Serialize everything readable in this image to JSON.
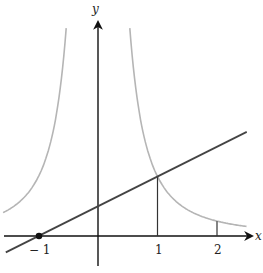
{
  "chart_data": {
    "type": "line",
    "title": "",
    "xlabel": "x",
    "ylabel": "y",
    "xlim": [
      -1.65,
      2.55
    ],
    "ylim": [
      -0.6,
      4.0
    ],
    "grid": false,
    "x_ticks": [
      -1,
      1,
      2
    ],
    "x_tick_labels": [
      "− 1",
      "1",
      "2"
    ],
    "series": [
      {
        "name": "curve y = 1/x^2",
        "color": "#b5b5b5",
        "type": "curve",
        "formula": "1/x^2",
        "points_right": [
          [
            0.55,
            3.3
          ],
          [
            0.75,
            1.78
          ],
          [
            1,
            1
          ],
          [
            1.5,
            0.44
          ],
          [
            2,
            0.25
          ],
          [
            2.5,
            0.16
          ]
        ],
        "points_left": [
          [
            -0.55,
            3.3
          ],
          [
            -0.75,
            1.78
          ],
          [
            -1,
            1
          ],
          [
            -1.2,
            0.69
          ],
          [
            -1.6,
            0.39
          ]
        ]
      },
      {
        "name": "line y = (x+1)/2",
        "color": "#444444",
        "type": "line",
        "formula": "(x+1)/2",
        "points": [
          [
            -1.55,
            -0.27
          ],
          [
            -1,
            0
          ],
          [
            0,
            0.5
          ],
          [
            1,
            1
          ],
          [
            2.5,
            1.75
          ]
        ]
      }
    ],
    "annotations": [
      {
        "type": "point",
        "x": -1,
        "y": 0,
        "label": "− 1"
      },
      {
        "type": "vertical-segment",
        "x": 1,
        "from": 0,
        "to": 1
      },
      {
        "type": "vertical-segment",
        "x": 2,
        "from": 0,
        "to": 0.25
      }
    ]
  },
  "labels": {
    "x_axis": "x",
    "y_axis": "y",
    "tick_neg1": "− 1",
    "tick_1": "1",
    "tick_2": "2"
  }
}
